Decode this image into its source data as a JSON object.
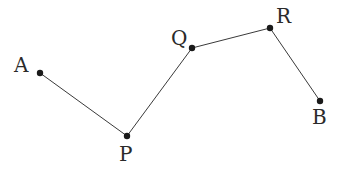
{
  "diagram": {
    "type": "polyline-path",
    "points": [
      {
        "id": "A",
        "label": "A",
        "x": 40,
        "y": 73,
        "lx": 14,
        "ly": 72
      },
      {
        "id": "P",
        "label": "P",
        "x": 127,
        "y": 136,
        "lx": 119,
        "ly": 161
      },
      {
        "id": "Q",
        "label": "Q",
        "x": 192,
        "y": 48,
        "lx": 171,
        "ly": 45
      },
      {
        "id": "R",
        "label": "R",
        "x": 270,
        "y": 28,
        "lx": 276,
        "ly": 23
      },
      {
        "id": "B",
        "label": "B",
        "x": 320,
        "y": 101,
        "lx": 312,
        "ly": 124
      }
    ],
    "segments": [
      [
        "A",
        "P"
      ],
      [
        "P",
        "Q"
      ],
      [
        "Q",
        "R"
      ],
      [
        "R",
        "B"
      ]
    ]
  }
}
